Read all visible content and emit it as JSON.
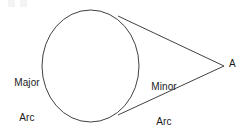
{
  "figure": {
    "background_color": "#ffffff",
    "stroke_color": "#2b2b2b",
    "text_color": "#1a1a1a",
    "width": 243,
    "height": 130
  },
  "labels": {
    "major_arc": {
      "line1": "Major",
      "line2": "Arc"
    },
    "minor_arc": {
      "line1": "Minor",
      "line2": "Arc"
    },
    "point_a": "A"
  },
  "geometry": {
    "circle": {
      "center_x": 90.5,
      "center_y": 66,
      "radius_x": 48.5,
      "radius_y": 56
    },
    "external_point": {
      "x": 224,
      "y": 66
    },
    "tangent_point_upper": {
      "x": 118,
      "y": 16
    },
    "tangent_point_lower": {
      "x": 118,
      "y": 115
    }
  }
}
